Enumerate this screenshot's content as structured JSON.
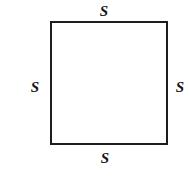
{
  "figure": {
    "name": "square-with-equal-side-labels",
    "shape": "square",
    "background_color": "#ffffff",
    "stroke_color": "#1c1c22",
    "stroke_width_px": 2,
    "fill_color": "#ffffff",
    "label_color": "#16161c",
    "label_style": "italic-serif-bold",
    "geometry": {
      "left_px": 50,
      "top_px": 21,
      "width_px": 118,
      "height_px": 124
    },
    "labels": {
      "top": "S",
      "left": "S",
      "right": "S",
      "bottom": "S"
    }
  }
}
